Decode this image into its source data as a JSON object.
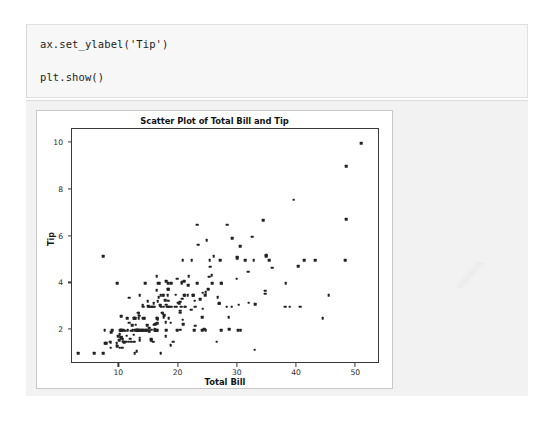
{
  "notebook": {
    "code_cell": {
      "lines": [
        "ax.set_ylabel('Tip')",
        "plt.show()"
      ]
    }
  },
  "chart_data": {
    "type": "scatter",
    "title": "Scatter Plot of Total Bill and Tip",
    "xlabel": "Total Bill",
    "ylabel": "Tip",
    "xlim": [
      2.0,
      54.0
    ],
    "ylim": [
      0.55,
      10.6
    ],
    "xticks": [
      10,
      20,
      30,
      40,
      50
    ],
    "yticks": [
      2,
      4,
      6,
      8,
      10
    ],
    "grid": false,
    "legend": false,
    "marker_color": "#222222",
    "marker_size": 2.6,
    "series": [
      {
        "name": "tips",
        "x": [
          16.99,
          10.34,
          21.01,
          23.68,
          24.59,
          25.29,
          8.77,
          26.88,
          15.04,
          14.78,
          10.27,
          35.26,
          15.42,
          18.43,
          14.83,
          21.58,
          10.33,
          16.29,
          16.97,
          20.65,
          17.92,
          20.29,
          15.77,
          39.42,
          19.82,
          17.81,
          13.37,
          12.69,
          21.7,
          19.65,
          9.55,
          18.35,
          15.06,
          20.69,
          17.78,
          24.06,
          16.31,
          16.93,
          18.69,
          31.27,
          16.04,
          17.46,
          13.94,
          9.68,
          30.4,
          18.29,
          22.23,
          32.4,
          28.55,
          18.04,
          12.54,
          10.29,
          34.81,
          9.94,
          25.56,
          19.49,
          38.01,
          26.41,
          11.24,
          48.27,
          20.29,
          13.81,
          11.02,
          18.29,
          17.59,
          20.08,
          16.45,
          3.07,
          20.23,
          15.01,
          12.02,
          17.07,
          26.86,
          25.28,
          14.73,
          10.51,
          17.92,
          27.2,
          22.76,
          17.29,
          19.44,
          16.66,
          10.07,
          32.68,
          15.98,
          34.83,
          13.03,
          18.28,
          24.71,
          21.16,
          28.97,
          22.49,
          5.75,
          16.32,
          22.75,
          40.17,
          27.28,
          12.03,
          21.01,
          12.46,
          11.35,
          15.38,
          44.3,
          22.42,
          20.92,
          15.36,
          20.49,
          25.21,
          18.24,
          14.31,
          14.0,
          7.25,
          38.07,
          23.95,
          25.71,
          17.31,
          29.93,
          10.65,
          12.43,
          24.08,
          11.69,
          13.42,
          14.26,
          15.95,
          12.48,
          29.8,
          8.52,
          14.52,
          11.38,
          22.82,
          19.08,
          20.27,
          11.17,
          12.26,
          18.26,
          8.51,
          10.33,
          14.15,
          16.0,
          13.16,
          17.47,
          34.3,
          41.19,
          27.05,
          16.43,
          8.35,
          18.64,
          11.87,
          9.78,
          7.51,
          14.07,
          13.13,
          17.26,
          24.55,
          19.77,
          29.85,
          48.17,
          25.0,
          13.39,
          16.49,
          21.5,
          12.66,
          16.21,
          13.81,
          17.51,
          24.52,
          20.76,
          31.71,
          10.59,
          10.63,
          50.81,
          15.81,
          7.25,
          31.85,
          16.82,
          32.9,
          17.89,
          14.48,
          9.6,
          34.63,
          34.65,
          23.33,
          45.35,
          23.17,
          40.55,
          20.69,
          20.9,
          30.46,
          18.15,
          23.1,
          15.69,
          19.81,
          28.44,
          15.48,
          16.58,
          7.56,
          10.34,
          43.11,
          13.0,
          13.51,
          18.71,
          12.74,
          13.0,
          16.4,
          20.53,
          16.47,
          26.59,
          38.73,
          24.27,
          12.76,
          30.06,
          25.89,
          48.33,
          13.27,
          28.17,
          12.9,
          28.15,
          11.59,
          7.74,
          30.14,
          12.16,
          13.42,
          8.58,
          15.98,
          13.42,
          16.27,
          10.09,
          20.45,
          13.28,
          22.12,
          24.01,
          15.69,
          11.61,
          10.77,
          15.53,
          10.07,
          12.6,
          32.83,
          35.83,
          29.03,
          27.18,
          22.67,
          17.82,
          18.78
        ],
        "y": [
          1.01,
          1.66,
          3.5,
          3.31,
          3.61,
          4.71,
          2.0,
          3.12,
          1.96,
          3.23,
          1.71,
          5.0,
          1.57,
          3.0,
          3.02,
          3.92,
          1.67,
          3.71,
          3.5,
          3.35,
          4.08,
          2.75,
          2.23,
          7.58,
          3.18,
          2.34,
          2.0,
          2.0,
          4.3,
          3.0,
          1.45,
          2.5,
          3.0,
          2.45,
          3.27,
          3.6,
          2.0,
          3.07,
          2.31,
          5.0,
          2.24,
          2.54,
          3.06,
          1.32,
          5.6,
          3.0,
          5.0,
          6.0,
          2.05,
          3.0,
          2.5,
          2.6,
          5.2,
          1.56,
          4.34,
          3.51,
          3.0,
          1.5,
          1.76,
          6.73,
          3.21,
          2.0,
          1.98,
          3.76,
          2.64,
          3.15,
          2.47,
          1.0,
          2.01,
          2.09,
          1.97,
          3.0,
          3.14,
          5.0,
          2.2,
          1.25,
          3.08,
          4.0,
          3.0,
          2.71,
          3.0,
          3.4,
          1.83,
          5.0,
          2.03,
          5.17,
          2.0,
          4.0,
          5.85,
          3.0,
          3.0,
          3.5,
          1.0,
          4.3,
          3.25,
          4.73,
          4.0,
          1.5,
          3.0,
          1.5,
          2.5,
          3.0,
          2.5,
          3.48,
          4.08,
          1.64,
          4.06,
          4.29,
          3.76,
          4.0,
          3.0,
          1.0,
          4.0,
          2.55,
          4.0,
          3.5,
          5.07,
          1.5,
          1.8,
          2.92,
          2.31,
          1.68,
          2.5,
          2.0,
          2.52,
          4.2,
          1.48,
          2.0,
          2.0,
          2.18,
          1.5,
          2.83,
          1.5,
          2.0,
          3.25,
          1.25,
          2.0,
          2.0,
          2.0,
          2.75,
          3.5,
          6.7,
          5.0,
          5.0,
          2.3,
          1.5,
          1.36,
          1.63,
          1.73,
          2.0,
          2.5,
          2.0,
          2.74,
          2.0,
          2.0,
          5.14,
          5.0,
          3.75,
          2.61,
          2.0,
          3.5,
          2.5,
          2.0,
          2.0,
          3.0,
          3.48,
          2.24,
          4.5,
          1.61,
          2.0,
          10.0,
          3.16,
          5.15,
          3.18,
          4.0,
          3.11,
          2.0,
          2.0,
          4.0,
          3.55,
          3.68,
          5.65,
          3.5,
          6.5,
          3.0,
          5.0,
          3.5,
          2.0,
          3.5,
          4.0,
          1.5,
          4.19,
          2.56,
          2.02,
          4.0,
          1.44,
          2.0,
          5.0,
          2.0,
          2.0,
          4.0,
          2.01,
          2.0,
          2.5,
          4.0,
          3.23,
          3.41,
          3.0,
          2.03,
          2.23,
          2.0,
          5.16,
          9.0,
          2.5,
          6.5,
          1.1,
          3.0,
          1.5,
          1.44,
          3.09,
          2.2,
          3.48,
          1.92,
          3.0,
          1.58,
          2.5,
          2.0,
          3.0,
          2.72,
          2.88,
          2.0,
          3.0,
          3.39,
          1.47,
          3.0,
          1.25,
          1.0,
          1.17,
          4.67,
          5.92,
          2.0,
          2.0,
          1.75,
          3.0
        ]
      }
    ]
  }
}
